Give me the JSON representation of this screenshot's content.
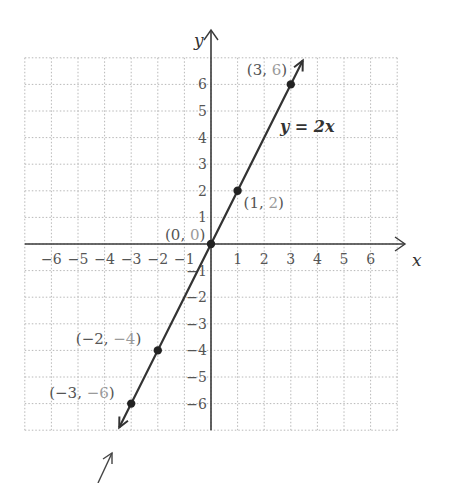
{
  "chart_data": {
    "type": "line",
    "title": "",
    "xlabel": "x",
    "ylabel": "y",
    "xlim": [
      -7,
      7
    ],
    "ylim": [
      -7,
      7
    ],
    "grid": true,
    "grid_style": "dotted",
    "x_ticks": [
      -6,
      -5,
      -4,
      -3,
      -2,
      -1,
      1,
      2,
      3,
      4,
      5,
      6
    ],
    "y_ticks": [
      -6,
      -5,
      -4,
      -3,
      -2,
      -1,
      1,
      2,
      3,
      4,
      5,
      6
    ],
    "x_tick_labels": [
      "−6",
      "−5",
      "−4",
      "−3",
      "−2",
      "−1",
      "1",
      "2",
      "3",
      "4",
      "5",
      "6"
    ],
    "y_tick_labels": [
      "−6",
      "−5",
      "−4",
      "−3",
      "−2",
      "−1",
      "1",
      "2",
      "3",
      "4",
      "5",
      "6"
    ],
    "series": [
      {
        "name": "y = 2x",
        "equation": "y = 2x",
        "x": [
          -3,
          -2,
          0,
          1,
          3
        ],
        "y": [
          -6,
          -4,
          0,
          2,
          6
        ]
      }
    ],
    "points": [
      {
        "x": 3,
        "y": 6,
        "label_x": "3",
        "label_y": "6"
      },
      {
        "x": 1,
        "y": 2,
        "label_x": "1",
        "label_y": "2"
      },
      {
        "x": 0,
        "y": 0,
        "label_x": "0",
        "label_y": "0"
      },
      {
        "x": -2,
        "y": -4,
        "label_x": "−2",
        "label_y": "−4"
      },
      {
        "x": -3,
        "y": -6,
        "label_x": "−3",
        "label_y": "−6"
      }
    ],
    "annotations": [
      "y = 2x"
    ],
    "legend": null
  },
  "labels": {
    "x_axis": "x",
    "y_axis": "y",
    "equation": "y = 2x"
  },
  "colors": {
    "line": "#333333",
    "axis": "#3a3a3a",
    "grid": "#b8b8b8",
    "label_dark": "#555555",
    "label_light": "#9a9a9a"
  }
}
